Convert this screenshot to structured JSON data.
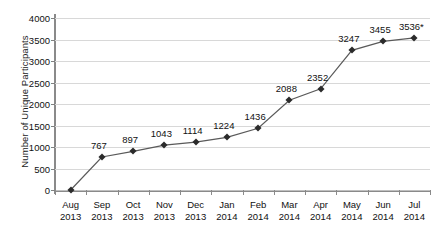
{
  "chart_data": {
    "type": "line",
    "title": "",
    "xlabel": "",
    "ylabel": "Number of Unique Participants",
    "ylim": [
      0,
      4000
    ],
    "ytick_values": [
      0,
      500,
      1000,
      1500,
      2000,
      2500,
      3000,
      3500,
      4000
    ],
    "ytick_labels": [
      "0",
      "500",
      "1000",
      "1500",
      "2000",
      "2500",
      "3000",
      "3500",
      "4000"
    ],
    "grid": true,
    "legend": "none",
    "categories": [
      {
        "month": "Aug",
        "year": "2013"
      },
      {
        "month": "Sep",
        "year": "2013"
      },
      {
        "month": "Oct",
        "year": "2013"
      },
      {
        "month": "Nov",
        "year": "2013"
      },
      {
        "month": "Dec",
        "year": "2013"
      },
      {
        "month": "Jan",
        "year": "2014"
      },
      {
        "month": "Feb",
        "year": "2014"
      },
      {
        "month": "Mar",
        "year": "2014"
      },
      {
        "month": "Apr",
        "year": "2014"
      },
      {
        "month": "May",
        "year": "2014"
      },
      {
        "month": "Jun",
        "year": "2014"
      },
      {
        "month": "Jul",
        "year": "2014"
      }
    ],
    "values": [
      0,
      767,
      897,
      1043,
      1114,
      1224,
      1436,
      2088,
      2352,
      3247,
      3455,
      3536
    ],
    "point_labels": [
      "",
      "767",
      "897",
      "1043",
      "1114",
      "1224",
      "1436",
      "2088",
      "2352",
      "3247",
      "3455",
      "3536*"
    ],
    "annotations": [
      "*"
    ],
    "colors": {
      "line": "#5a5a5a",
      "marker": "#2b2b2b",
      "grid": "#d8d8d8",
      "axis": "#8a8a8a",
      "text": "#111111",
      "background": "#ffffff"
    }
  }
}
